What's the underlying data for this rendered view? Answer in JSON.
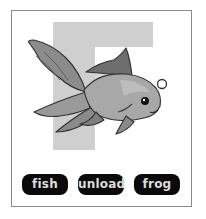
{
  "card": {
    "letter": "F",
    "image": "goldfish-illustration",
    "colors": {
      "letter_fill": "#cfcfcf",
      "frame": "#8a8a8a",
      "button_bg": "#0a0a0a",
      "button_text": "#dcdcdc"
    }
  },
  "options": [
    {
      "label": "fish"
    },
    {
      "label": "unload"
    },
    {
      "label": "frog"
    }
  ]
}
